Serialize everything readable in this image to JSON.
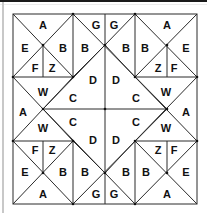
{
  "puzzle": {
    "description": "Symmetric geometric dissection puzzle with letter-labeled regions",
    "border": {
      "x": 13,
      "y": 14,
      "width": 184,
      "height": 190
    },
    "lines": [
      [
        73,
        14,
        73,
        77
      ],
      [
        135,
        14,
        135,
        77
      ],
      [
        105,
        14,
        105,
        204
      ],
      [
        13,
        77,
        73,
        77
      ],
      [
        135,
        77,
        197,
        77
      ],
      [
        13,
        141,
        73,
        141
      ],
      [
        135,
        141,
        197,
        141
      ],
      [
        73,
        141,
        73,
        204
      ],
      [
        135,
        141,
        135,
        204
      ],
      [
        43,
        109,
        167,
        109
      ],
      [
        43,
        45,
        43,
        77
      ],
      [
        167,
        45,
        167,
        77
      ],
      [
        43,
        141,
        43,
        173
      ],
      [
        167,
        141,
        167,
        173
      ],
      [
        13,
        14,
        73,
        77
      ],
      [
        73,
        14,
        13,
        77
      ],
      [
        73,
        14,
        167,
        109
      ],
      [
        135,
        14,
        43,
        109
      ],
      [
        197,
        14,
        135,
        77
      ],
      [
        135,
        14,
        197,
        77
      ],
      [
        13,
        77,
        73,
        141
      ],
      [
        73,
        77,
        13,
        141
      ],
      [
        73,
        77,
        105,
        45
      ],
      [
        135,
        77,
        105,
        45
      ],
      [
        197,
        77,
        135,
        141
      ],
      [
        135,
        77,
        197,
        141
      ],
      [
        43,
        109,
        135,
        204
      ],
      [
        167,
        109,
        73,
        204
      ],
      [
        13,
        141,
        73,
        204
      ],
      [
        73,
        141,
        13,
        204
      ],
      [
        135,
        141,
        197,
        204
      ],
      [
        197,
        141,
        135,
        204
      ],
      [
        73,
        141,
        105,
        173
      ],
      [
        135,
        141,
        105,
        173
      ]
    ],
    "nodes": [
      [
        73,
        14
      ],
      [
        135,
        14
      ],
      [
        43,
        45
      ],
      [
        105,
        45
      ],
      [
        167,
        45
      ],
      [
        13,
        77
      ],
      [
        73,
        77
      ],
      [
        135,
        77
      ],
      [
        197,
        77
      ],
      [
        43,
        109
      ],
      [
        105,
        109
      ],
      [
        167,
        109
      ],
      [
        13,
        141
      ],
      [
        73,
        141
      ],
      [
        135,
        141
      ],
      [
        197,
        141
      ],
      [
        43,
        173
      ],
      [
        105,
        173
      ],
      [
        167,
        173
      ],
      [
        73,
        204
      ],
      [
        135,
        204
      ]
    ],
    "labels": [
      {
        "text": "A",
        "x": 43,
        "y": 25
      },
      {
        "text": "E",
        "x": 25,
        "y": 48
      },
      {
        "text": "B",
        "x": 63,
        "y": 48
      },
      {
        "text": "F",
        "x": 35,
        "y": 68
      },
      {
        "text": "Z",
        "x": 52,
        "y": 68
      },
      {
        "text": "B",
        "x": 85,
        "y": 48
      },
      {
        "text": "G",
        "x": 96,
        "y": 25
      },
      {
        "text": "G",
        "x": 114,
        "y": 25
      },
      {
        "text": "B",
        "x": 126,
        "y": 48
      },
      {
        "text": "B",
        "x": 145,
        "y": 48
      },
      {
        "text": "A",
        "x": 167,
        "y": 25
      },
      {
        "text": "E",
        "x": 186,
        "y": 48
      },
      {
        "text": "Z",
        "x": 158,
        "y": 68
      },
      {
        "text": "F",
        "x": 174,
        "y": 68
      },
      {
        "text": "D",
        "x": 93,
        "y": 80
      },
      {
        "text": "D",
        "x": 116,
        "y": 80
      },
      {
        "text": "W",
        "x": 43,
        "y": 92
      },
      {
        "text": "C",
        "x": 73,
        "y": 98
      },
      {
        "text": "A",
        "x": 23,
        "y": 112
      },
      {
        "text": "C",
        "x": 73,
        "y": 122
      },
      {
        "text": "W",
        "x": 43,
        "y": 128
      },
      {
        "text": "C",
        "x": 136,
        "y": 98
      },
      {
        "text": "W",
        "x": 166,
        "y": 92
      },
      {
        "text": "A",
        "x": 186,
        "y": 112
      },
      {
        "text": "C",
        "x": 136,
        "y": 122
      },
      {
        "text": "W",
        "x": 166,
        "y": 128
      },
      {
        "text": "D",
        "x": 93,
        "y": 140
      },
      {
        "text": "D",
        "x": 116,
        "y": 140
      },
      {
        "text": "F",
        "x": 35,
        "y": 150
      },
      {
        "text": "Z",
        "x": 52,
        "y": 150
      },
      {
        "text": "E",
        "x": 25,
        "y": 172
      },
      {
        "text": "B",
        "x": 63,
        "y": 172
      },
      {
        "text": "A",
        "x": 43,
        "y": 194
      },
      {
        "text": "B",
        "x": 85,
        "y": 172
      },
      {
        "text": "G",
        "x": 96,
        "y": 194
      },
      {
        "text": "G",
        "x": 114,
        "y": 194
      },
      {
        "text": "B",
        "x": 126,
        "y": 172
      },
      {
        "text": "Z",
        "x": 158,
        "y": 150
      },
      {
        "text": "F",
        "x": 174,
        "y": 150
      },
      {
        "text": "B",
        "x": 146,
        "y": 172
      },
      {
        "text": "E",
        "x": 186,
        "y": 172
      },
      {
        "text": "A",
        "x": 167,
        "y": 194
      }
    ]
  },
  "colors": {
    "background": "#ffffff",
    "line": "#2a2a2a",
    "text": "#111111",
    "frame_top": "#1a1a1a",
    "frame_left": "#c8c8c8"
  }
}
